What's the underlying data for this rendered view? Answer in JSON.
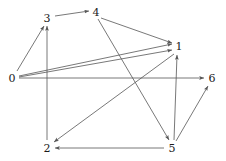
{
  "figure": {
    "type": "directed-graph",
    "width": 226,
    "height": 161,
    "background_color": "#ffffff",
    "edge_color": "#555555",
    "label_color": "#1a1a1a"
  },
  "graph_data": {
    "type": "diagram",
    "directed": true,
    "node_count": 7,
    "edge_count": 11,
    "nodes": [
      {
        "id": "0",
        "label": "0",
        "x": 12,
        "y": 78
      },
      {
        "id": "1",
        "label": "1",
        "x": 179,
        "y": 46
      },
      {
        "id": "2",
        "label": "2",
        "x": 47,
        "y": 148
      },
      {
        "id": "3",
        "label": "3",
        "x": 47,
        "y": 18
      },
      {
        "id": "4",
        "label": "4",
        "x": 96,
        "y": 12
      },
      {
        "id": "5",
        "label": "5",
        "x": 172,
        "y": 148
      },
      {
        "id": "6",
        "label": "6",
        "x": 212,
        "y": 78
      }
    ],
    "edges": [
      {
        "from": "0",
        "to": "3",
        "x1": 17,
        "y1": 71,
        "x2": 44,
        "y2": 26
      },
      {
        "from": "0",
        "to": "1",
        "x1": 19,
        "y1": 76,
        "x2": 172,
        "y2": 44
      },
      {
        "from": "0",
        "to": "1",
        "x1": 19,
        "y1": 77,
        "x2": 172,
        "y2": 50
      },
      {
        "from": "0",
        "to": "6",
        "x1": 19,
        "y1": 78,
        "x2": 204,
        "y2": 78
      },
      {
        "from": "3",
        "to": "4",
        "x1": 55,
        "y1": 16,
        "x2": 89,
        "y2": 11
      },
      {
        "from": "4",
        "to": "1",
        "x1": 101,
        "y1": 18,
        "x2": 172,
        "y2": 43
      },
      {
        "from": "4",
        "to": "5",
        "x1": 98,
        "y1": 19,
        "x2": 169,
        "y2": 140
      },
      {
        "from": "5",
        "to": "1",
        "x1": 174,
        "y1": 140,
        "x2": 177,
        "y2": 55
      },
      {
        "from": "5",
        "to": "6",
        "x1": 176,
        "y1": 141,
        "x2": 208,
        "y2": 86
      },
      {
        "from": "5",
        "to": "2",
        "x1": 164,
        "y1": 148,
        "x2": 55,
        "y2": 148
      },
      {
        "from": "1",
        "to": "2",
        "x1": 174,
        "y1": 54,
        "x2": 54,
        "y2": 142
      },
      {
        "from": "2",
        "to": "3",
        "x1": 47,
        "y1": 140,
        "x2": 47,
        "y2": 26
      }
    ]
  }
}
